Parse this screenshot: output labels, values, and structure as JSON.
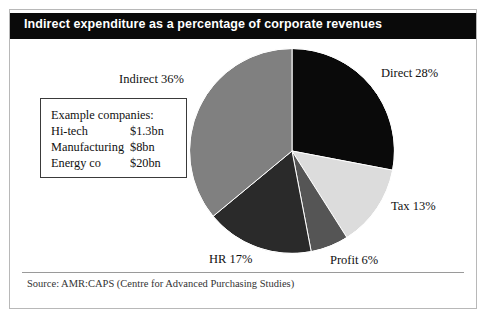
{
  "figure": {
    "title": "Indirect expenditure as a percentage of corporate revenues",
    "source": "Source: AMR:CAPS (Centre for Advanced Purchasing Studies)"
  },
  "note_box": {
    "heading": "Example companies:",
    "rows": [
      {
        "name": "Hi-tech",
        "value": "$1.3bn"
      },
      {
        "name": "Manufacturing",
        "value": "$8bn"
      },
      {
        "name": "Energy co",
        "value": "$20bn"
      }
    ]
  },
  "labels": {
    "indirect": "Indirect 36%",
    "direct": "Direct 28%",
    "tax": "Tax 13%",
    "profit": "Profit 6%",
    "hr": "HR 17%"
  },
  "colors": {
    "title_bar": "#0a0a0a",
    "title_text": "#ffffff",
    "frame": "#b8b8b8",
    "direct": "#0a0a0a",
    "tax": "#dcdcdc",
    "profit": "#555555",
    "hr": "#2a2a2a",
    "indirect": "#808080",
    "slice_outline": "#ffffff"
  },
  "chart_data": {
    "type": "pie",
    "title": "Indirect expenditure as a percentage of corporate revenues",
    "xlabel": "",
    "ylabel": "",
    "unit": "%",
    "start_angle_deg": 0,
    "direction": "clockwise",
    "legend": "callout-labels",
    "grid": false,
    "categories": [
      "Direct",
      "Tax",
      "Profit",
      "HR",
      "Indirect"
    ],
    "values": [
      28,
      13,
      6,
      17,
      36
    ],
    "slices": [
      {
        "label": "Direct",
        "value": 28,
        "display": "Direct 28%",
        "color": "#0a0a0a"
      },
      {
        "label": "Tax",
        "value": 13,
        "display": "Tax 13%",
        "color": "#dcdcdc"
      },
      {
        "label": "Profit",
        "value": 6,
        "display": "Profit 6%",
        "color": "#555555"
      },
      {
        "label": "HR",
        "value": 17,
        "display": "HR 17%",
        "color": "#2a2a2a"
      },
      {
        "label": "Indirect",
        "value": 36,
        "display": "Indirect 36%",
        "color": "#808080"
      }
    ],
    "annotations": [
      "Example companies:",
      "Hi-tech $1.3bn",
      "Manufacturing $8bn",
      "Energy co $20bn"
    ],
    "source": "Source: AMR:CAPS (Centre for Advanced Purchasing Studies)"
  }
}
